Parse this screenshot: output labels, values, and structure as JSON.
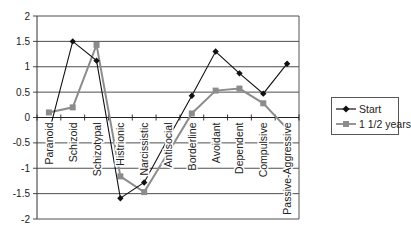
{
  "chart_data": {
    "type": "line",
    "title": "",
    "xlabel": "",
    "ylabel": "",
    "ylim": [
      -2,
      2
    ],
    "yticks": [
      2,
      1.5,
      1,
      0.5,
      0,
      -0.5,
      -1,
      -1.5,
      -2
    ],
    "ytick_labels": [
      "2",
      "1.5",
      "1",
      "0.5",
      "0",
      "-0.5",
      "-1",
      "-1.5",
      "-2"
    ],
    "grid": true,
    "legend_position": "right",
    "categories": [
      "Paranoid",
      "Schizoid",
      "Schizotypal",
      "Histrionic",
      "Narcissistic",
      "Antisocial",
      "Borderline",
      "Avoidant",
      "Dependent",
      "Compulsive",
      "Passive-Aggressive"
    ],
    "series": [
      {
        "name": "Start",
        "color": "#111111",
        "marker": "diamond",
        "values": [
          -0.3,
          1.5,
          1.12,
          -1.59,
          -1.28,
          -0.42,
          0.43,
          1.3,
          0.87,
          0.47,
          1.06
        ],
        "marker_visible": [
          false,
          true,
          true,
          true,
          true,
          false,
          true,
          true,
          true,
          true,
          true
        ]
      },
      {
        "name": "1 1/2 years",
        "color": "#8c8c8c",
        "marker": "square",
        "values": [
          0.1,
          0.2,
          1.43,
          -1.16,
          -1.47,
          -0.7,
          0.08,
          0.53,
          0.57,
          0.28,
          -0.22
        ],
        "marker_visible": [
          true,
          true,
          true,
          true,
          true,
          false,
          true,
          true,
          true,
          true,
          false
        ]
      }
    ]
  },
  "legend": {
    "items": [
      {
        "label": "Start"
      },
      {
        "label": "1 1/2 years"
      }
    ]
  }
}
